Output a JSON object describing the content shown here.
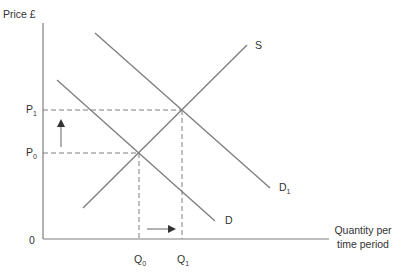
{
  "diagram": {
    "type": "supply-demand",
    "y_axis_label": "Price £",
    "x_axis_label_line1": "Quantity per",
    "x_axis_label_line2": "time period",
    "origin_label": "0",
    "curves": {
      "supply": {
        "label": "S"
      },
      "demand": {
        "label": "D"
      },
      "demand_shifted": {
        "label": "D",
        "subscript": "1"
      }
    },
    "price_levels": {
      "p0": {
        "label": "P",
        "subscript": "0"
      },
      "p1": {
        "label": "P",
        "subscript": "1"
      }
    },
    "quantity_levels": {
      "q0": {
        "label": "Q",
        "subscript": "0"
      },
      "q1": {
        "label": "Q",
        "subscript": "1"
      }
    },
    "arrows": {
      "price_change": "up",
      "quantity_change": "right"
    },
    "colors": {
      "line": "#7f7f7f",
      "axis": "#7f7f7f",
      "text": "#333333"
    }
  }
}
